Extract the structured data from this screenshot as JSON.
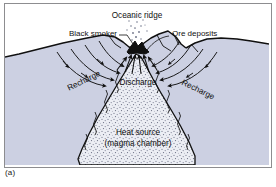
{
  "figure": {
    "caption": "(a)",
    "title_label": "Oceanic ridge",
    "labels": {
      "oceanic_ridge": "Oceanic ridge",
      "black_smoker": "Black smoker",
      "ore_deposits": "Ore deposits",
      "discharge": "Discharge",
      "recharge_left": "Recharge",
      "recharge_right": "Recharge",
      "heat_source_line1": "Heat source",
      "heat_source_line2": "(magma chamber)"
    },
    "colors": {
      "crust_fill": "#ccd0e2",
      "water_fill": "#ffffff",
      "magma_fill": "#e8e9f0",
      "outline": "#101010",
      "frame_border": "#8d8d90",
      "text": "#111111"
    },
    "diagram_type": "hydrothermal-circulation-cross-section",
    "flow_arrows": {
      "recharge_direction": "downward and inward toward axis",
      "discharge_direction": "upward at ridge axis"
    }
  }
}
